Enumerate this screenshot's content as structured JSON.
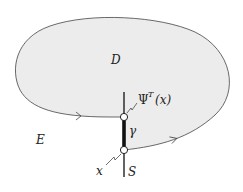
{
  "diagram": {
    "labels": {
      "region_inside": "D",
      "region_outside": "E",
      "section": "S",
      "segment": "γ",
      "point_start": "x",
      "map_psi": "Ψ",
      "map_sup": "T",
      "map_arg": "(x)"
    },
    "colors": {
      "fill": "#ececec",
      "stroke": "#444444",
      "thick_segment": "#111111"
    }
  }
}
